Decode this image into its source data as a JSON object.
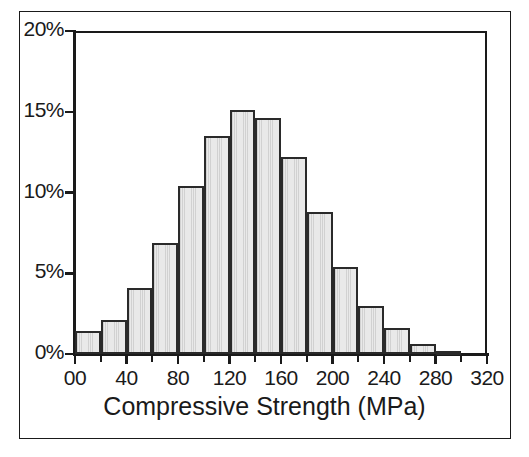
{
  "chart_data": {
    "type": "bar",
    "title": "",
    "subtitle": "",
    "xlabel": "Compressive Strength (MPa)",
    "ylabel": "",
    "xlim": [
      0,
      320
    ],
    "ylim": [
      0,
      20
    ],
    "grid": false,
    "legend": null,
    "bin_width": 20,
    "x_tick_labels": [
      "00",
      "40",
      "80",
      "120",
      "160",
      "200",
      "240",
      "280",
      "320"
    ],
    "x_tick_values": [
      0,
      40,
      80,
      120,
      160,
      200,
      240,
      280,
      320
    ],
    "x_minor_tick_values": [
      20,
      60,
      100,
      140,
      180,
      220,
      260,
      300
    ],
    "y_tick_labels": [
      "0%",
      "5%",
      "10%",
      "15%",
      "20%"
    ],
    "y_tick_values": [
      0,
      5,
      10,
      15,
      20
    ],
    "categories": [
      "0-20",
      "20-40",
      "40-60",
      "60-80",
      "80-100",
      "100-120",
      "120-140",
      "140-160",
      "160-180",
      "180-200",
      "200-220",
      "220-240",
      "240-260",
      "260-280",
      "280-300",
      "300-320"
    ],
    "bin_starts": [
      0,
      20,
      40,
      60,
      80,
      100,
      120,
      140,
      160,
      180,
      200,
      220,
      240,
      260,
      280,
      300
    ],
    "values": [
      1.4,
      2.1,
      4.1,
      6.9,
      10.4,
      13.5,
      15.1,
      14.6,
      12.2,
      8.8,
      5.4,
      3.0,
      1.6,
      0.6,
      0.2,
      0.0
    ],
    "value_unit": "%",
    "series": [
      {
        "name": "Relative frequency",
        "values": [
          1.4,
          2.1,
          4.1,
          6.9,
          10.4,
          13.5,
          15.1,
          14.6,
          12.2,
          8.8,
          5.4,
          3.0,
          1.6,
          0.6,
          0.2,
          0.0
        ]
      }
    ],
    "colors": {
      "bar_fill": "#e9e9e9",
      "bar_edge": "#2a2a2a",
      "axis": "#1a1a1a",
      "background": "#ffffff"
    }
  }
}
